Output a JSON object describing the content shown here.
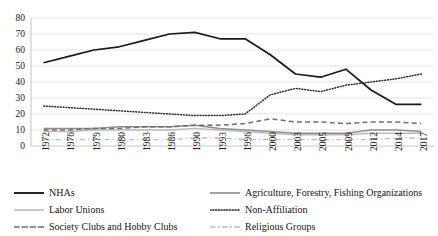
{
  "chart_data": {
    "type": "line",
    "title": "",
    "subtitle": "",
    "xlabel": "",
    "ylabel": "",
    "ylim": [
      0,
      80
    ],
    "yticks": [
      0,
      10,
      20,
      30,
      40,
      50,
      60,
      70,
      80
    ],
    "grid": true,
    "legend_position": "bottom",
    "categories": [
      "1972",
      "1976",
      "1979",
      "1980",
      "1983",
      "1986",
      "1990",
      "1993",
      "1996",
      "2000",
      "2003",
      "2005",
      "2009",
      "2012",
      "2014",
      "2017"
    ],
    "series": [
      {
        "name": "NHAs",
        "style": "solid",
        "color": "#1a1a1a",
        "values": [
          52,
          56,
          60,
          62,
          66,
          70,
          71,
          67,
          67,
          57,
          45,
          43,
          48,
          35,
          26,
          26
        ]
      },
      {
        "name": "Agriculture, Forestry, Fishing Organizations",
        "style": "solid",
        "color": "#8f8f8f",
        "values": [
          11,
          11,
          11,
          12,
          12,
          12,
          13,
          11,
          10,
          9,
          8,
          8,
          8,
          10,
          10,
          9
        ]
      },
      {
        "name": "Labor Unions",
        "style": "solid",
        "color": "#b9b9b9",
        "values": [
          9,
          9,
          10,
          10,
          10,
          10,
          11,
          10,
          9,
          8,
          7,
          7,
          7,
          8,
          8,
          8
        ]
      },
      {
        "name": "Non-Affiliation",
        "style": "dotted",
        "color": "#2b2b2b",
        "values": [
          25,
          24,
          23,
          22,
          21,
          20,
          19,
          19,
          20,
          32,
          36,
          34,
          38,
          40,
          42,
          45
        ]
      },
      {
        "name": "Society Clubs and Hobby Clubs",
        "style": "dashed",
        "color": "#6e6e6e",
        "values": [
          10,
          10,
          11,
          11,
          12,
          12,
          13,
          13,
          14,
          17,
          15,
          15,
          14,
          15,
          15,
          14
        ]
      },
      {
        "name": "Religious Groups",
        "style": "dash-dot",
        "color": "#bdbdbd",
        "values": [
          4,
          4,
          4,
          4,
          4,
          4,
          5,
          5,
          4,
          4,
          4,
          4,
          4,
          4,
          5,
          5
        ]
      }
    ]
  },
  "legend": {
    "items": [
      {
        "label": "NHAs",
        "key": "s-nhas"
      },
      {
        "label": "Agriculture, Forestry, Fishing Organizations",
        "key": "s-agri"
      },
      {
        "label": "Labor Unions",
        "key": "s-labor"
      },
      {
        "label": "Non-Affiliation",
        "key": "s-nonaff"
      },
      {
        "label": "Society Clubs and Hobby Clubs",
        "key": "s-society"
      },
      {
        "label": "Religious Groups",
        "key": "s-religious"
      }
    ]
  }
}
